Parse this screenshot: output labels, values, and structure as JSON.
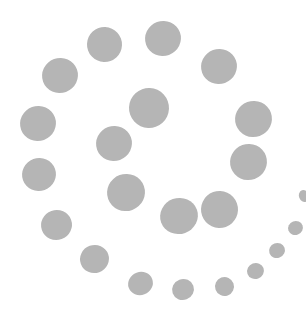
{
  "graphic": {
    "description": "Spiral of gray dots",
    "dot_color": "#b5b5b5",
    "background": "#ffffff",
    "dots": [
      {
        "cx": 104,
        "cy": 44,
        "w": 35,
        "h": 35
      },
      {
        "cx": 163,
        "cy": 38,
        "w": 36,
        "h": 35
      },
      {
        "cx": 60,
        "cy": 75,
        "w": 36,
        "h": 35
      },
      {
        "cx": 219,
        "cy": 66,
        "w": 36,
        "h": 35
      },
      {
        "cx": 149,
        "cy": 108,
        "w": 40,
        "h": 40
      },
      {
        "cx": 38,
        "cy": 123,
        "w": 36,
        "h": 35
      },
      {
        "cx": 253,
        "cy": 119,
        "w": 37,
        "h": 36
      },
      {
        "cx": 114,
        "cy": 143,
        "w": 36,
        "h": 35
      },
      {
        "cx": 248,
        "cy": 162,
        "w": 37,
        "h": 36
      },
      {
        "cx": 39,
        "cy": 174,
        "w": 34,
        "h": 33
      },
      {
        "cx": 126,
        "cy": 192,
        "w": 38,
        "h": 37
      },
      {
        "cx": 219,
        "cy": 209,
        "w": 37,
        "h": 37
      },
      {
        "cx": 179,
        "cy": 216,
        "w": 38,
        "h": 36
      },
      {
        "cx": 56,
        "cy": 225,
        "w": 31,
        "h": 30
      },
      {
        "cx": 94,
        "cy": 259,
        "w": 29,
        "h": 28
      },
      {
        "cx": 140,
        "cy": 283,
        "w": 25,
        "h": 23
      },
      {
        "cx": 183,
        "cy": 289,
        "w": 22,
        "h": 21
      },
      {
        "cx": 224,
        "cy": 286,
        "w": 19,
        "h": 19
      },
      {
        "cx": 255,
        "cy": 271,
        "w": 17,
        "h": 16
      },
      {
        "cx": 277,
        "cy": 250,
        "w": 16,
        "h": 15
      },
      {
        "cx": 295,
        "cy": 228,
        "w": 15,
        "h": 14
      },
      {
        "cx": 304,
        "cy": 196,
        "w": 10,
        "h": 12
      }
    ]
  }
}
